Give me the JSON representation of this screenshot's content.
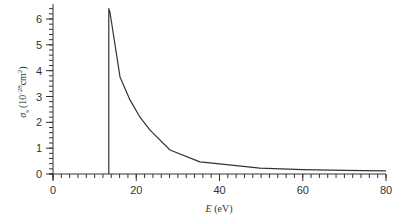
{
  "chart_data": {
    "type": "line",
    "title": "",
    "xlabel": "E (eV)",
    "xlabel_italic": "E",
    "xlabel_unit": "(eV)",
    "ylabel": "σ_s (10^-28 cm^2)",
    "ylabel_symbol": "σ",
    "ylabel_sub": "s",
    "ylabel_unit_base": "(10",
    "ylabel_exp": "-28",
    "ylabel_unit_cm": "cm",
    "ylabel_cm_exp": "2",
    "ylabel_close": ")",
    "xlim": [
      0,
      80
    ],
    "ylim": [
      0,
      6.5
    ],
    "xticks": [
      0,
      20,
      40,
      60,
      80
    ],
    "yticks": [
      0,
      1,
      2,
      3,
      4,
      5,
      6
    ],
    "x_minor_step": 2,
    "y_minor_step": 0.2,
    "grid": false,
    "legend": null,
    "series": [
      {
        "name": "cross section",
        "color": "#333333",
        "x": [
          13.4,
          13.4,
          13.7,
          16.1,
          18.5,
          20.9,
          23.3,
          28.1,
          35.3,
          37.7,
          49.7,
          60,
          70,
          80
        ],
        "y": [
          0,
          6.4,
          6.25,
          3.76,
          2.87,
          2.2,
          1.7,
          0.93,
          0.47,
          0.43,
          0.23,
          0.17,
          0.14,
          0.12
        ]
      }
    ]
  }
}
